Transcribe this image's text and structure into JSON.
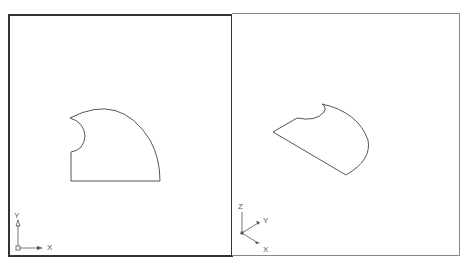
{
  "viewports": [
    {
      "name": "top-view",
      "active": true,
      "ucs_icon": {
        "type": "2d",
        "x_label": "X",
        "y_label": "Y"
      }
    },
    {
      "name": "isometric-view",
      "active": false,
      "ucs_icon": {
        "type": "3d",
        "x_label": "X",
        "y_label": "Y",
        "z_label": "Z"
      }
    }
  ],
  "colors": {
    "active_border": "#333333",
    "inactive_border": "#888888",
    "geometry": "#555555",
    "background": "#ffffff"
  }
}
